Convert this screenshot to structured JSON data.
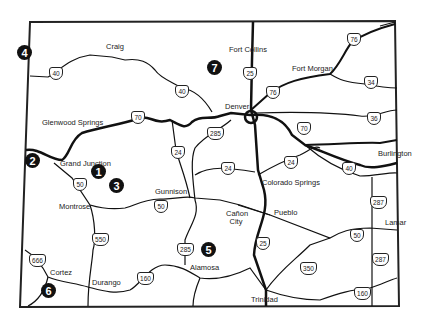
{
  "map": {
    "title": "Colorado highway map",
    "colors": {
      "roads": "#111111",
      "background": "#ffffff",
      "markers": "#111111"
    },
    "cities": [
      {
        "name": "Craig",
        "x": 115,
        "y": 49
      },
      {
        "name": "Fort Collins",
        "x": 229,
        "y": 49
      },
      {
        "name": "Fort Morgan",
        "x": 292,
        "y": 68
      },
      {
        "name": "Denver",
        "x": 225,
        "y": 106
      },
      {
        "name": "Glenwood Springs",
        "x": 42,
        "y": 122
      },
      {
        "name": "Burlington",
        "x": 378,
        "y": 152
      },
      {
        "name": "Grand Junction",
        "x": 60,
        "y": 163
      },
      {
        "name": "Gunnison",
        "x": 155,
        "y": 191
      },
      {
        "name": "Colorado Springs",
        "x": 262,
        "y": 182
      },
      {
        "name": "Montrose",
        "x": 59,
        "y": 206
      },
      {
        "name": "Cañon City",
        "x": 226,
        "y": 212
      },
      {
        "name": "Pueblo",
        "x": 274,
        "y": 212
      },
      {
        "name": "Lamar",
        "x": 385,
        "y": 222
      },
      {
        "name": "Cortez",
        "x": 50,
        "y": 272
      },
      {
        "name": "Alamosa",
        "x": 190,
        "y": 267
      },
      {
        "name": "Durango",
        "x": 92,
        "y": 282
      },
      {
        "name": "Trinidad",
        "x": 251,
        "y": 299
      }
    ],
    "markers": [
      {
        "label": "1",
        "x": 98,
        "y": 171
      },
      {
        "label": "2",
        "x": 32,
        "y": 160
      },
      {
        "label": "3",
        "x": 116,
        "y": 185
      },
      {
        "label": "4",
        "x": 24,
        "y": 52
      },
      {
        "label": "5",
        "x": 208,
        "y": 249
      },
      {
        "label": "6",
        "x": 48,
        "y": 290
      },
      {
        "label": "7",
        "x": 214,
        "y": 67
      }
    ],
    "shields": [
      {
        "num": "40",
        "x": 49,
        "y": 67
      },
      {
        "num": "40",
        "x": 175,
        "y": 85
      },
      {
        "num": "25",
        "x": 243,
        "y": 67
      },
      {
        "num": "76",
        "x": 266,
        "y": 86
      },
      {
        "num": "76",
        "x": 347,
        "y": 33
      },
      {
        "num": "34",
        "x": 364,
        "y": 76
      },
      {
        "num": "70",
        "x": 131,
        "y": 111
      },
      {
        "num": "70",
        "x": 297,
        "y": 122
      },
      {
        "num": "285",
        "x": 207,
        "y": 127
      },
      {
        "num": "24",
        "x": 171,
        "y": 146
      },
      {
        "num": "36",
        "x": 367,
        "y": 112
      },
      {
        "num": "24",
        "x": 221,
        "y": 162
      },
      {
        "num": "24",
        "x": 284,
        "y": 156
      },
      {
        "num": "40",
        "x": 342,
        "y": 162
      },
      {
        "num": "50",
        "x": 73,
        "y": 178
      },
      {
        "num": "50",
        "x": 154,
        "y": 200
      },
      {
        "num": "287",
        "x": 370,
        "y": 196
      },
      {
        "num": "550",
        "x": 92,
        "y": 233
      },
      {
        "num": "285",
        "x": 177,
        "y": 243
      },
      {
        "num": "25",
        "x": 256,
        "y": 237
      },
      {
        "num": "50",
        "x": 350,
        "y": 229
      },
      {
        "num": "287",
        "x": 372,
        "y": 253
      },
      {
        "num": "666",
        "x": 29,
        "y": 254
      },
      {
        "num": "350",
        "x": 300,
        "y": 262
      },
      {
        "num": "160",
        "x": 137,
        "y": 272
      },
      {
        "num": "160",
        "x": 354,
        "y": 287
      }
    ]
  }
}
